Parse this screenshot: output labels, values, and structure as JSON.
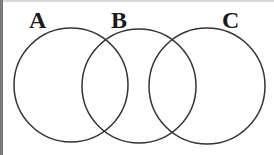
{
  "diagram": {
    "type": "venn",
    "sets": [
      {
        "label": "A",
        "cx": 71,
        "cy": 85,
        "r": 57,
        "label_x": 38,
        "label_y": 27
      },
      {
        "label": "B",
        "cx": 139,
        "cy": 86,
        "r": 57,
        "label_x": 119,
        "label_y": 27
      },
      {
        "label": "C",
        "cx": 207,
        "cy": 86,
        "r": 58,
        "label_x": 231,
        "label_y": 27
      }
    ],
    "stroke_color": "#333333",
    "background": "#ffffff"
  }
}
